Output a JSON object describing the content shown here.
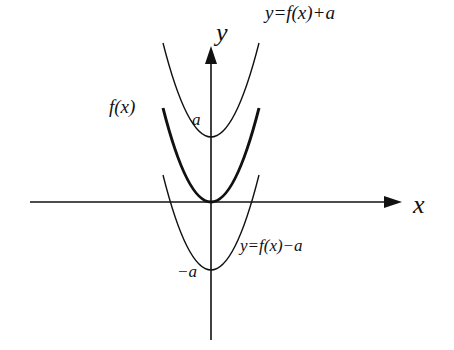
{
  "diagram": {
    "axes": {
      "x_label": "x",
      "y_label": "y"
    },
    "curves": [
      {
        "id": "shift-up",
        "label": "y=f(x)+a",
        "style": "thin",
        "vertex_value": "a"
      },
      {
        "id": "original",
        "label": "f(x)",
        "style": "bold",
        "vertex_value": "0"
      },
      {
        "id": "shift-down",
        "label": "y=f(x)−a",
        "style": "thin",
        "vertex_value": "−a"
      }
    ],
    "tick_labels": {
      "positive": "a",
      "negative": "−a"
    },
    "colors": {
      "line": "#111111",
      "background": "#ffffff"
    }
  }
}
